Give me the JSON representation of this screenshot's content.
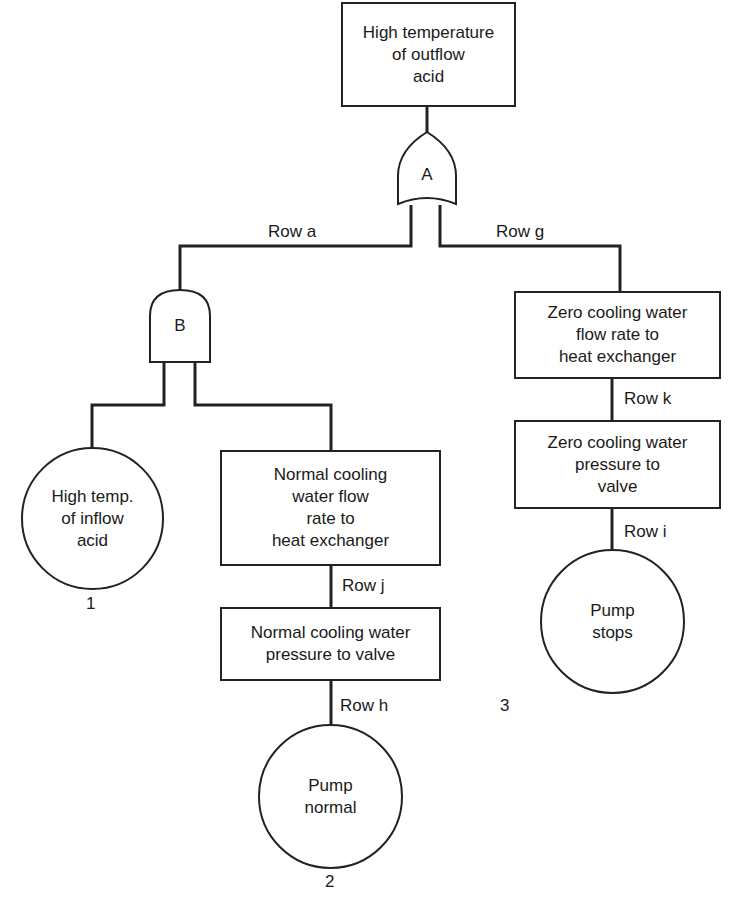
{
  "diagram": {
    "type": "fault-tree",
    "top_event": {
      "label": "High temperature\nof outflow\nacid"
    },
    "gates": [
      {
        "id": "A",
        "label": "A",
        "kind": "OR"
      },
      {
        "id": "B",
        "label": "B",
        "kind": "AND"
      }
    ],
    "rows": {
      "a": "Row a",
      "g": "Row g",
      "k": "Row k",
      "i": "Row i",
      "j": "Row j",
      "h": "Row h"
    },
    "events": {
      "zero_flow": "Zero cooling water\nflow rate to\nheat exchanger",
      "zero_pressure": "Zero cooling water\npressure to\nvalve",
      "normal_flow": "Normal cooling\nwater flow\nrate to\nheat exchanger",
      "normal_pressure": "Normal cooling water\npressure to valve"
    },
    "basic_events": [
      {
        "label": "High temp.\nof inflow\nacid",
        "number": "1"
      },
      {
        "label": "Pump\nnormal",
        "number": "2"
      },
      {
        "label": "Pump\nstops",
        "number": "3"
      }
    ]
  }
}
